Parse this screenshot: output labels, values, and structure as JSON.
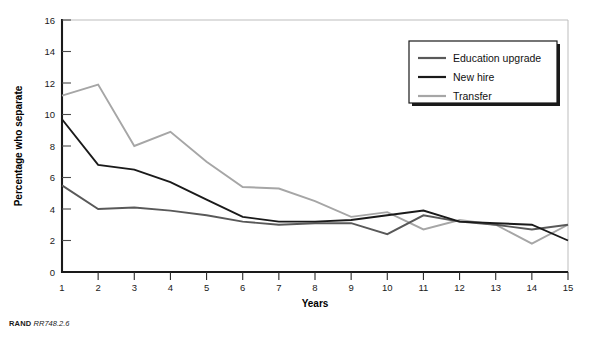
{
  "chart_data": {
    "type": "line",
    "title": "",
    "xlabel": "Years",
    "ylabel": "Percentage who separate",
    "x": [
      1,
      2,
      3,
      4,
      5,
      6,
      7,
      8,
      9,
      10,
      11,
      12,
      13,
      14,
      15
    ],
    "xlim": [
      1,
      15
    ],
    "ylim": [
      0,
      16
    ],
    "ytick_step": 2,
    "yticks": [
      0,
      2,
      4,
      6,
      8,
      10,
      12,
      14,
      16
    ],
    "xticks": [
      1,
      2,
      3,
      4,
      5,
      6,
      7,
      8,
      9,
      10,
      11,
      12,
      13,
      14,
      15
    ],
    "grid": false,
    "legend_position": "top-right",
    "series": [
      {
        "name": "Education upgrade",
        "color": "#595959",
        "values": [
          5.5,
          4.0,
          4.1,
          3.9,
          3.6,
          3.2,
          3.0,
          3.1,
          3.1,
          2.4,
          3.6,
          3.2,
          3.0,
          2.7,
          3.0
        ]
      },
      {
        "name": "New hire",
        "color": "#1a1a1a",
        "values": [
          9.7,
          6.8,
          6.5,
          5.7,
          4.6,
          3.5,
          3.2,
          3.2,
          3.3,
          3.6,
          3.9,
          3.2,
          3.1,
          3.0,
          2.0
        ]
      },
      {
        "name": "Transfer",
        "color": "#a6a6a6",
        "values": [
          11.2,
          11.9,
          8.0,
          8.9,
          7.0,
          5.4,
          5.3,
          4.5,
          3.5,
          3.8,
          2.7,
          3.3,
          3.0,
          1.8,
          3.0
        ]
      }
    ]
  },
  "legend": {
    "entries": [
      {
        "label": "Education upgrade",
        "color": "#595959"
      },
      {
        "label": "New hire",
        "color": "#1a1a1a"
      },
      {
        "label": "Transfer",
        "color": "#a6a6a6"
      }
    ]
  },
  "axes": {
    "x_title": "Years",
    "y_title": "Percentage who separate"
  },
  "footer": {
    "brand": "RAND",
    "identifier": "RR748.2.6"
  }
}
